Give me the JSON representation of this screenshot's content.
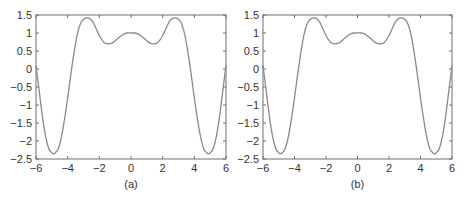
{
  "figure": {
    "panels": [
      {
        "id": "a",
        "caption": "(a)",
        "plot_left": 36,
        "plot_right": 226,
        "plot_top": 15,
        "plot_bottom": 159
      },
      {
        "id": "b",
        "caption": "(b)",
        "plot_left": 263,
        "plot_right": 452,
        "plot_top": 15,
        "plot_bottom": 159
      }
    ],
    "colors": {
      "curve": "#8a8a8a",
      "axes": "#6e6e6e",
      "text": "#333333"
    }
  },
  "chart_data": [
    {
      "type": "line",
      "title": "",
      "caption": "(a)",
      "xlabel": "",
      "ylabel": "",
      "xlim": [
        -6,
        6
      ],
      "ylim": [
        -2.5,
        1.5
      ],
      "xticks": [
        "-6",
        "-4",
        "-2",
        "0",
        "2",
        "4",
        "6"
      ],
      "yticks": [
        "1.5",
        "1",
        "0.5",
        "0",
        "-0.5",
        "-1",
        "-1.5",
        "-2",
        "-2.5"
      ],
      "grid": false,
      "legend": null,
      "series": [
        {
          "name": "curve",
          "x": [
            -6,
            -5.8,
            -5.6,
            -5.4,
            -5.2,
            -5.0,
            -4.85,
            -4.6,
            -4.4,
            -4.2,
            -4.0,
            -3.8,
            -3.6,
            -3.4,
            -3.2,
            -3.0,
            -2.8,
            -2.6,
            -2.4,
            -2.2,
            -2.0,
            -1.8,
            -1.6,
            -1.4,
            -1.2,
            -1.0,
            -0.8,
            -0.6,
            -0.4,
            -0.2,
            0,
            0.2,
            0.4,
            0.6,
            0.8,
            1.0,
            1.2,
            1.4,
            1.6,
            1.8,
            2.0,
            2.2,
            2.4,
            2.6,
            2.8,
            3.0,
            3.2,
            3.4,
            3.6,
            3.8,
            4.0,
            4.2,
            4.4,
            4.6,
            4.85,
            5.0,
            5.2,
            5.4,
            5.6,
            5.8,
            6
          ],
          "y": [
            0.1,
            -0.6,
            -1.3,
            -1.85,
            -2.2,
            -2.33,
            -2.35,
            -2.22,
            -1.9,
            -1.4,
            -0.8,
            -0.15,
            0.45,
            0.95,
            1.25,
            1.38,
            1.42,
            1.4,
            1.3,
            1.12,
            0.93,
            0.79,
            0.71,
            0.7,
            0.72,
            0.78,
            0.86,
            0.93,
            0.98,
            1.0,
            1.0,
            1.0,
            0.98,
            0.93,
            0.86,
            0.78,
            0.72,
            0.7,
            0.71,
            0.79,
            0.93,
            1.12,
            1.3,
            1.4,
            1.42,
            1.38,
            1.25,
            0.95,
            0.45,
            -0.15,
            -0.8,
            -1.4,
            -1.9,
            -2.22,
            -2.35,
            -2.33,
            -2.2,
            -1.85,
            -1.3,
            -0.6,
            0.1
          ]
        }
      ]
    },
    {
      "type": "line",
      "title": "",
      "caption": "(b)",
      "xlabel": "",
      "ylabel": "",
      "xlim": [
        -6,
        6
      ],
      "ylim": [
        -2.5,
        1.5
      ],
      "xticks": [
        "-6",
        "-4",
        "-2",
        "0",
        "2",
        "4",
        "6"
      ],
      "yticks": [
        "1.5",
        "1",
        "0.5",
        "0",
        "-0.5",
        "-1",
        "-1.5",
        "-2",
        "-2.5"
      ],
      "grid": false,
      "legend": null,
      "series": [
        {
          "name": "curve",
          "x": [
            -6,
            -5.8,
            -5.6,
            -5.4,
            -5.2,
            -5.0,
            -4.85,
            -4.6,
            -4.4,
            -4.2,
            -4.0,
            -3.8,
            -3.6,
            -3.4,
            -3.2,
            -3.0,
            -2.8,
            -2.6,
            -2.4,
            -2.2,
            -2.0,
            -1.8,
            -1.6,
            -1.4,
            -1.2,
            -1.0,
            -0.8,
            -0.6,
            -0.4,
            -0.2,
            0,
            0.2,
            0.4,
            0.6,
            0.8,
            1.0,
            1.2,
            1.4,
            1.6,
            1.8,
            2.0,
            2.2,
            2.4,
            2.6,
            2.8,
            3.0,
            3.2,
            3.4,
            3.6,
            3.8,
            4.0,
            4.2,
            4.4,
            4.6,
            4.85,
            5.0,
            5.2,
            5.4,
            5.6,
            5.8,
            6
          ],
          "y": [
            0.1,
            -0.6,
            -1.3,
            -1.85,
            -2.2,
            -2.33,
            -2.35,
            -2.22,
            -1.9,
            -1.4,
            -0.8,
            -0.15,
            0.45,
            0.95,
            1.25,
            1.38,
            1.42,
            1.4,
            1.3,
            1.12,
            0.93,
            0.79,
            0.71,
            0.7,
            0.72,
            0.78,
            0.86,
            0.93,
            0.98,
            1.0,
            1.0,
            1.0,
            0.98,
            0.93,
            0.86,
            0.78,
            0.72,
            0.7,
            0.71,
            0.79,
            0.93,
            1.12,
            1.3,
            1.4,
            1.42,
            1.38,
            1.25,
            0.95,
            0.45,
            -0.15,
            -0.8,
            -1.4,
            -1.9,
            -2.22,
            -2.35,
            -2.33,
            -2.2,
            -1.85,
            -1.3,
            -0.6,
            0.1
          ]
        }
      ]
    }
  ]
}
